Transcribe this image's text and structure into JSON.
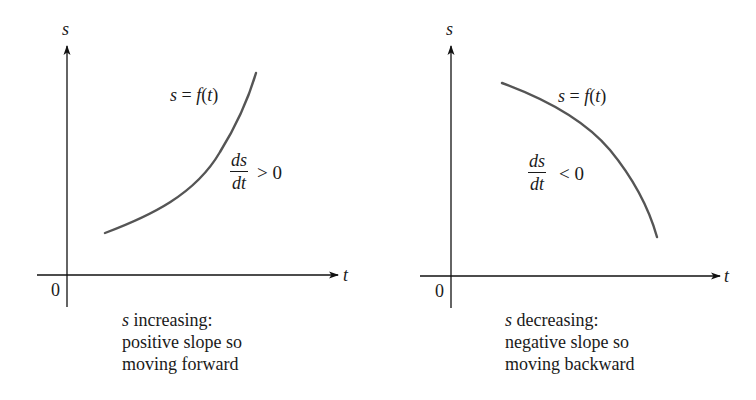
{
  "figure": {
    "panels": [
      {
        "id": "left",
        "axes": {
          "y_label": "s",
          "x_label": "t",
          "origin_label": "0"
        },
        "curve": {
          "label_var": "s",
          "label_eq": " = ",
          "label_func": "f",
          "label_arg_open": "(",
          "label_arg": "t",
          "label_arg_close": ")",
          "shape": "increasing, concave up",
          "color": "#555555"
        },
        "derivative": {
          "numerator": "ds",
          "denominator": "dt",
          "relation": "> 0"
        },
        "caption": {
          "var": "s",
          "line1_rest": " increasing:",
          "line2": "positive slope so",
          "line3": "moving forward"
        }
      },
      {
        "id": "right",
        "axes": {
          "y_label": "s",
          "x_label": "t",
          "origin_label": "0"
        },
        "curve": {
          "label_var": "s",
          "label_eq": " = ",
          "label_func": "f",
          "label_arg_open": "(",
          "label_arg": "t",
          "label_arg_close": ")",
          "shape": "decreasing, concave down",
          "color": "#555555"
        },
        "derivative": {
          "numerator": "ds",
          "denominator": "dt",
          "relation": "< 0"
        },
        "caption": {
          "var": "s",
          "line1_rest": " decreasing:",
          "line2": "negative slope so",
          "line3": "moving backward"
        }
      }
    ],
    "colors": {
      "axis": "#111111",
      "curve": "#555555",
      "text": "#1a1a1a",
      "background": "#ffffff"
    }
  }
}
